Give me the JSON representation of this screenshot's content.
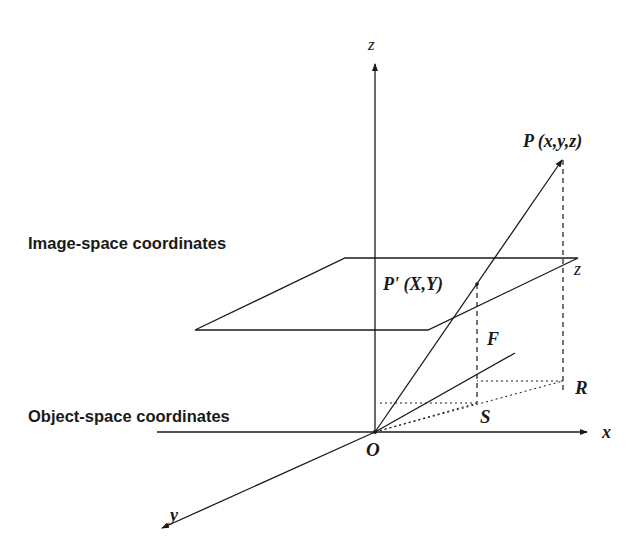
{
  "diagram": {
    "labels": {
      "z_axis": "z",
      "x_axis": "x",
      "y_axis": "y",
      "origin": "O",
      "point_P": "P (x,y,z)",
      "point_P_prime": "P' (X,Y)",
      "height_z": "z",
      "focal_F": "F",
      "point_R": "R",
      "point_S": "S",
      "image_space": "Image-space coordinates",
      "object_space": "Object-space coordinates"
    },
    "colors": {
      "stroke": "#1a1a1a",
      "background": "#ffffff"
    }
  }
}
